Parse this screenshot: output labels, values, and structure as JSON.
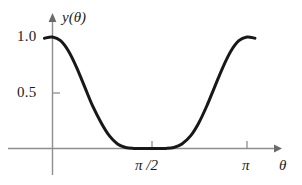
{
  "figure": {
    "name": "function-plot",
    "background_color": "#ffffff",
    "curve_color": "#181818",
    "axis_color": "#8e8e8e"
  },
  "axes": {
    "y_title": "y(θ)",
    "x_title": "θ",
    "y_ticks": [
      {
        "label": "1.0",
        "value": 1.0
      },
      {
        "label": "0.5",
        "value": 0.5
      }
    ],
    "x_ticks": [
      {
        "label": "π /2",
        "value": 1.5707963
      },
      {
        "label": "π",
        "value": 3.1415927
      }
    ]
  },
  "chart_data": {
    "type": "line",
    "title": "",
    "subtitle": "",
    "xlabel": "θ",
    "ylabel": "y(θ)",
    "xlim": [
      -0.13,
      3.36
    ],
    "ylim": [
      -0.06,
      1.1
    ],
    "grid": false,
    "legend": null,
    "xtick_values": [
      1.5707963,
      3.1415927
    ],
    "xtick_labels": [
      "π /2",
      "π"
    ],
    "ytick_values": [
      0.5,
      1.0
    ],
    "ytick_labels": [
      "0.5",
      "1.0"
    ],
    "series": [
      {
        "name": "y(θ)",
        "color": "#181818",
        "x": [
          -0.13,
          0.0,
          0.13,
          0.26,
          0.39,
          0.52,
          0.65,
          0.79,
          0.92,
          1.05,
          1.18,
          1.31,
          1.44,
          1.57,
          1.7,
          1.83,
          1.96,
          2.09,
          2.23,
          2.36,
          2.49,
          2.62,
          2.75,
          2.88,
          3.01,
          3.14,
          3.27
        ],
        "y": [
          0.989,
          1.0,
          0.967,
          0.872,
          0.726,
          0.553,
          0.379,
          0.227,
          0.113,
          0.041,
          0.009,
          0.0006,
          0.0,
          0.0,
          0.0,
          0.0006,
          0.009,
          0.041,
          0.113,
          0.227,
          0.379,
          0.553,
          0.726,
          0.872,
          0.967,
          1.0,
          0.989
        ]
      }
    ],
    "annotations": []
  }
}
